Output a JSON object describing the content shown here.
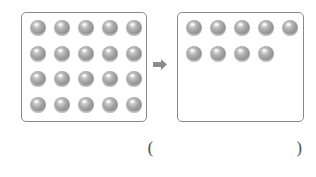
{
  "figure": {
    "left_box": {
      "label": "initial collection",
      "rows": 4,
      "columns": 5,
      "ball_count": 20
    },
    "arrow": {
      "icon": "right-arrow-icon",
      "color": "#8c8c8c"
    },
    "right_box": {
      "label": "resulting collection",
      "ball_count": 9,
      "rows": [
        5,
        4
      ]
    },
    "answer": {
      "open_paren": "(",
      "value": "",
      "close_paren": ")"
    },
    "colors": {
      "ball": "#9a9a9a",
      "border": "#8a8a8a",
      "text": "#555555"
    }
  }
}
